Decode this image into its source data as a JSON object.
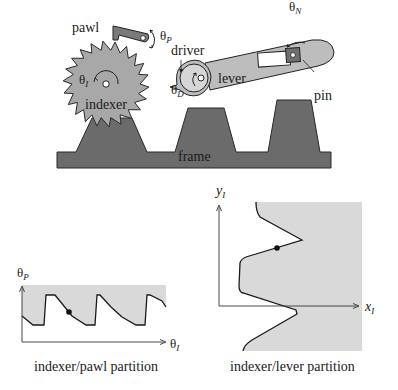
{
  "diagram": {
    "mechanism": {
      "labels": {
        "pawl": "pawl",
        "theta_p": "θ",
        "theta_p_sub": "P",
        "driver": "driver",
        "theta_n": "θ",
        "theta_n_sub": "N",
        "theta_i": "θ",
        "theta_i_sub": "I",
        "theta_d": "θ",
        "theta_d_sub": "D",
        "lever": "lever",
        "pin": "pin",
        "indexer": "indexer",
        "frame": "frame"
      },
      "colors": {
        "frame": "#6b6b6b",
        "indexer": "#a8a8a8",
        "driver": "#c4c4c4",
        "lever": "#bdbdbd",
        "pawl": "#7a7a7a",
        "outline": "#222222"
      }
    },
    "pawl_plot": {
      "y_label": "θ",
      "y_label_sub": "P",
      "x_label": "θ",
      "x_label_sub": "I",
      "caption": "indexer/pawl partition",
      "region_color": "#d9d9d9"
    },
    "lever_plot": {
      "y_label": "y",
      "y_label_sub": "I",
      "x_label": "x",
      "x_label_sub": "I",
      "caption": "indexer/lever partition",
      "region_color": "#d9d9d9"
    }
  }
}
